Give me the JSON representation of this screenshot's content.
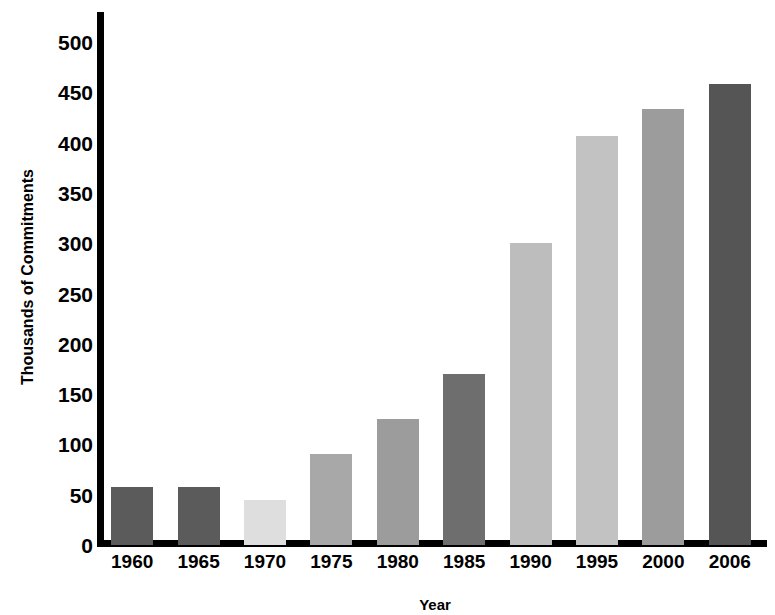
{
  "chart_data": {
    "type": "bar",
    "title": "",
    "subtitle": "",
    "xlabel": "Year",
    "ylabel": "Thousands of Commitments",
    "categories": [
      "1960",
      "1965",
      "1970",
      "1975",
      "1980",
      "1985",
      "1990",
      "1995",
      "2000",
      "2006"
    ],
    "values": [
      58,
      58,
      45,
      90,
      125,
      170,
      300,
      407,
      433,
      458
    ],
    "bar_colors": [
      "#5b5b5b",
      "#5b5b5b",
      "#dedede",
      "#a8a8a8",
      "#9c9c9c",
      "#6e6e6e",
      "#bdbdbd",
      "#c2c2c2",
      "#9c9c9c",
      "#555555"
    ],
    "ylim": [
      0,
      500
    ],
    "ytick_values": [
      0,
      50,
      100,
      150,
      200,
      250,
      300,
      350,
      400,
      450,
      500
    ],
    "ytick_labels": [
      "0",
      "50",
      "100",
      "150",
      "200",
      "250",
      "300",
      "350",
      "400",
      "450",
      "500"
    ],
    "grid": false,
    "legend": null,
    "legend_position": "none",
    "axis_color": "#000000",
    "background_color": "#ffffff"
  }
}
